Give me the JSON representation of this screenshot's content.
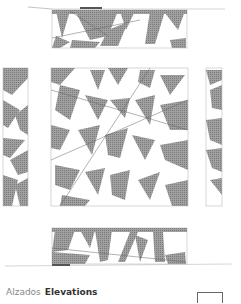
{
  "caption": {
    "spanish": "Alzados",
    "english": "Elevations"
  },
  "drawing": {
    "panels": [
      {
        "name": "north-elevation",
        "x": 52,
        "y": 10,
        "w": 135,
        "h": 38
      },
      {
        "name": "west-elevation",
        "x": 3,
        "y": 68,
        "w": 25,
        "h": 138
      },
      {
        "name": "main-elevation",
        "x": 51,
        "y": 68,
        "w": 137,
        "h": 138
      },
      {
        "name": "east-elevation",
        "x": 206,
        "y": 68,
        "w": 16,
        "h": 138
      },
      {
        "name": "south-elevation",
        "x": 52,
        "y": 228,
        "w": 135,
        "h": 36
      }
    ],
    "colors": {
      "hatch": "#8a8a8a",
      "line": "#666666",
      "frame": "#bbbbbb"
    }
  }
}
